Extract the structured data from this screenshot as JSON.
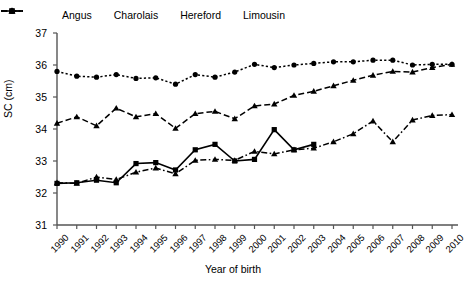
{
  "chart_data": {
    "type": "line",
    "title": "",
    "xlabel": "Year of birth",
    "ylabel": "SC (cm)",
    "ylim": [
      31,
      37
    ],
    "yticks": [
      31,
      32,
      33,
      34,
      35,
      36,
      37
    ],
    "grid": false,
    "legend_position": "top",
    "categories": [
      "1990",
      "1991",
      "1992",
      "1993",
      "1994",
      "1995",
      "1996",
      "1997",
      "1998",
      "1999",
      "2000",
      "2001",
      "2002",
      "2003",
      "2004",
      "2005",
      "2006",
      "2007",
      "2008",
      "2009",
      "2010"
    ],
    "series": [
      {
        "name": "Angus",
        "marker": "circle",
        "linestyle": "dotted",
        "color": "#000000",
        "values": [
          35.8,
          35.65,
          35.62,
          35.7,
          35.58,
          35.6,
          35.4,
          35.7,
          35.62,
          35.78,
          36.02,
          35.92,
          36.0,
          36.05,
          36.1,
          36.1,
          36.15,
          36.15,
          36.0,
          36.02,
          36.02
        ]
      },
      {
        "name": "Charolais",
        "marker": "triangle",
        "linestyle": "dashed",
        "color": "#000000",
        "values": [
          34.18,
          34.38,
          34.1,
          34.65,
          34.38,
          34.48,
          34.02,
          34.48,
          34.55,
          34.32,
          34.72,
          34.78,
          35.05,
          35.18,
          35.35,
          35.52,
          35.68,
          35.8,
          35.78,
          35.92,
          36.02
        ]
      },
      {
        "name": "Hereford",
        "marker": "square",
        "linestyle": "solid",
        "color": "#000000",
        "values": [
          32.3,
          32.32,
          32.4,
          32.32,
          32.92,
          32.95,
          32.72,
          33.35,
          33.52,
          33.0,
          33.05,
          33.98,
          33.35,
          33.52,
          null,
          null,
          null,
          null,
          null,
          null,
          null
        ]
      },
      {
        "name": "Limousin",
        "marker": "triangle",
        "linestyle": "dash-dot",
        "color": "#000000",
        "values": [
          32.32,
          32.3,
          32.5,
          32.42,
          32.65,
          32.78,
          32.6,
          33.02,
          33.05,
          33.02,
          33.3,
          33.22,
          33.35,
          33.4,
          33.6,
          33.85,
          34.25,
          33.6,
          34.28,
          34.42,
          34.45
        ]
      }
    ]
  },
  "legend": {
    "items": [
      {
        "label": "Angus",
        "marker": "circle",
        "linestyle": "dotted"
      },
      {
        "label": "Charolais",
        "marker": "triangle",
        "linestyle": "dashed"
      },
      {
        "label": "Hereford",
        "marker": "square",
        "linestyle": "solid"
      },
      {
        "label": "Limousin",
        "marker": "triangle",
        "linestyle": "dash-dot"
      }
    ]
  },
  "axes": {
    "y_title": "SC (cm)",
    "x_title": "Year of birth"
  }
}
